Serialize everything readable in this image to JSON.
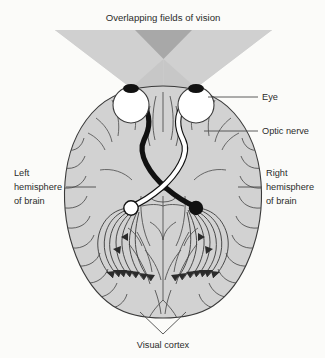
{
  "figure": {
    "title": "Overlapping fields of vision"
  },
  "labels": {
    "overlapping_fields": "Overlapping fields of vision",
    "eye": "Eye",
    "optic_nerve": "Optic nerve",
    "left_hemisphere_line1": "Left",
    "left_hemisphere_line2": "hemisphere",
    "left_hemisphere_line3": "of brain",
    "right_hemisphere_line1": "Right",
    "right_hemisphere_line2": "hemisphere",
    "right_hemisphere_line3": "of brain",
    "visual_cortex": "Visual cortex"
  },
  "colors": {
    "background": "#fbfbf9",
    "brain_fill": "#d2d2d2",
    "brain_stroke": "#3a3a3a",
    "cone_fill": "#d0d0d0",
    "cone_overlap_fill": "#a8a8a8",
    "nerve_dark": "#111111",
    "nerve_light": "#ffffff",
    "eye_fill": "#ffffff",
    "pupil": "#111111",
    "text": "#2b2b2b",
    "leader_line": "#4a4a4a"
  },
  "structures": {
    "left_eye": "left-eye",
    "right_eye": "right-eye",
    "optic_chiasm": "optic-chiasm",
    "left_lateral_geniculate": "white-terminal-node",
    "right_lateral_geniculate": "black-terminal-node",
    "optic_radiations": "fanning-fibers-with-arrowheads"
  }
}
